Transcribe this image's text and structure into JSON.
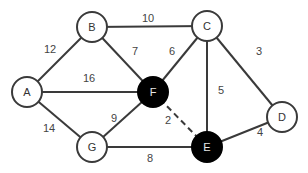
{
  "graph": {
    "nodes": {
      "A": {
        "label": "A",
        "filled": false
      },
      "B": {
        "label": "B",
        "filled": false
      },
      "C": {
        "label": "C",
        "filled": false
      },
      "D": {
        "label": "D",
        "filled": false
      },
      "E": {
        "label": "E",
        "filled": true
      },
      "F": {
        "label": "F",
        "filled": true
      },
      "G": {
        "label": "G",
        "filled": false
      }
    },
    "edges": {
      "A_B": {
        "weight": "12",
        "style": "solid"
      },
      "B_C": {
        "weight": "10",
        "style": "solid"
      },
      "B_F": {
        "weight": "7",
        "style": "solid"
      },
      "A_F": {
        "weight": "16",
        "style": "solid"
      },
      "C_F": {
        "weight": "6",
        "style": "solid"
      },
      "C_D": {
        "weight": "3",
        "style": "solid"
      },
      "C_E": {
        "weight": "5",
        "style": "solid"
      },
      "A_G": {
        "weight": "14",
        "style": "solid"
      },
      "G_F": {
        "weight": "9",
        "style": "solid"
      },
      "F_E": {
        "weight": "2",
        "style": "dashed"
      },
      "G_E": {
        "weight": "8",
        "style": "solid"
      },
      "E_D": {
        "weight": "4",
        "style": "solid"
      }
    }
  },
  "colors": {
    "edge": "#3a3a3a",
    "filled_node": "#000000",
    "open_node": "#ffffff"
  }
}
